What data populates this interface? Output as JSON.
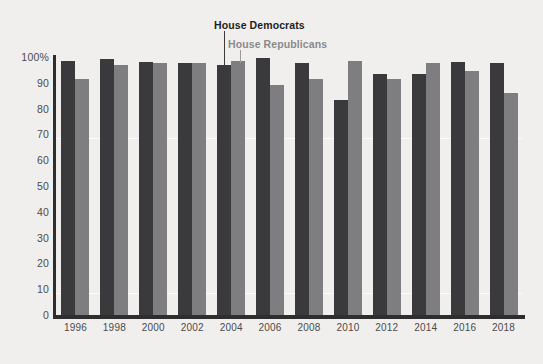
{
  "chart_data": {
    "type": "bar",
    "title": "",
    "subtitle": "",
    "xlabel": "",
    "ylabel": "",
    "ylim": [
      0,
      100
    ],
    "yticks": [
      "0",
      "10",
      "20",
      "30",
      "40",
      "50",
      "60",
      "70",
      "80",
      "90",
      "100%"
    ],
    "ytick_values": [
      0,
      10,
      20,
      30,
      40,
      50,
      60,
      70,
      80,
      90,
      100
    ],
    "grid": "faint horizontal white gridlines at 10 and 70",
    "legend_position": "inline direct labels above 2004 group",
    "categories": [
      "1996",
      "1998",
      "2000",
      "2002",
      "2004",
      "2006",
      "2008",
      "2010",
      "2012",
      "2014",
      "2016",
      "2018"
    ],
    "series": [
      {
        "name": "House Democrats",
        "color": "#3a3a3c",
        "values": [
          98.5,
          99.2,
          98.0,
          97.5,
          97.0,
          99.5,
          97.5,
          83.5,
          93.5,
          93.5,
          98.0,
          97.5
        ]
      },
      {
        "name": "House Republicans",
        "color": "#7e7e80",
        "values": [
          91.5,
          97.0,
          97.5,
          97.5,
          98.5,
          89.0,
          91.5,
          98.5,
          91.5,
          97.5,
          94.5,
          86.0
        ]
      }
    ],
    "annotations": [
      {
        "name": "leader-line-democrats",
        "text": "House Democrats",
        "points_to": "2004 House Democrats bar"
      },
      {
        "name": "leader-line-republicans",
        "text": "House Republicans",
        "points_to": "2004 House Republicans bar"
      }
    ]
  },
  "legend": {
    "democrats_label": "House Democrats",
    "republicans_label": "House Republicans"
  },
  "colors": {
    "democrats": "#3a3a3c",
    "republicans": "#7e7e80",
    "background": "#f1efed",
    "axis": "#2e2e2e",
    "tick_text": "#4b4b4b"
  }
}
